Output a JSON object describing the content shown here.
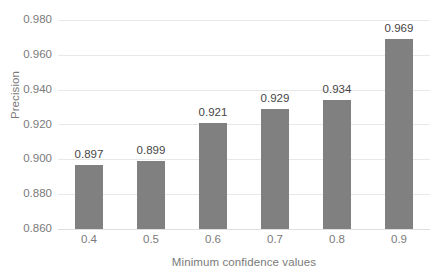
{
  "chart_data": {
    "type": "bar",
    "title": "",
    "xlabel": "Minimum confidence values",
    "ylabel": "Precision",
    "categories": [
      "0.4",
      "0.5",
      "0.6",
      "0.7",
      "0.8",
      "0.9"
    ],
    "values": [
      0.897,
      0.899,
      0.921,
      0.929,
      0.934,
      0.969
    ],
    "data_labels": [
      "0.897",
      "0.899",
      "0.921",
      "0.929",
      "0.934",
      "0.969"
    ],
    "ylim": [
      0.86,
      0.98
    ],
    "ytick_step": 0.02,
    "ytick_labels": [
      "0.980",
      "0.960",
      "0.940",
      "0.920",
      "0.900",
      "0.880",
      "0.860"
    ],
    "ytick_values": [
      0.98,
      0.96,
      0.94,
      0.92,
      0.9,
      0.88,
      0.86
    ],
    "xtick_labels": [
      "0.4",
      "0.5",
      "0.6",
      "0.7",
      "0.8",
      "0.9"
    ],
    "grid": true,
    "grid_axis": "y",
    "legend": false,
    "legend_position": "none",
    "series": [
      {
        "name": "Precision",
        "values": [
          0.897,
          0.899,
          0.921,
          0.929,
          0.934,
          0.969
        ],
        "color": "#808080"
      }
    ],
    "colors": {
      "bar": "#808080",
      "gridline": "#e8e8e8",
      "axis_text": "#7a7a7a",
      "data_label_text": "#464646",
      "background": "#ffffff"
    }
  }
}
